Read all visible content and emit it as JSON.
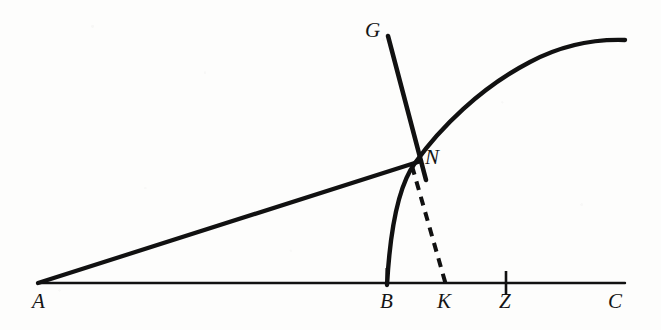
{
  "figure": {
    "kind": "geometric-diagram",
    "width": 661,
    "height": 330,
    "background_color": "#fdfdfc",
    "ink_color": "#111111"
  },
  "labels": {
    "a": "A",
    "b": "B",
    "c": "C",
    "g": "G",
    "k": "K",
    "n": "N",
    "z": "Z"
  },
  "geometry": {
    "baseline": {
      "name": "line-A-C",
      "from": [
        38,
        283
      ],
      "to": [
        625,
        283
      ],
      "stroke_width": 2.4
    },
    "ray_AN": {
      "name": "ray-A-through-N",
      "from": [
        38,
        283
      ],
      "to": [
        420,
        161
      ],
      "stroke_width": 4.2
    },
    "line_G": {
      "name": "line-G-through-N",
      "from": [
        388,
        36
      ],
      "to": [
        425,
        178
      ],
      "stroke_width": 4.6
    },
    "curve_BN": {
      "name": "curve-B-to-N-to-right",
      "start": [
        387,
        284
      ],
      "control_1": [
        392,
        215
      ],
      "control_2": [
        400,
        182
      ],
      "through_N": [
        415,
        163
      ],
      "far_control_1": [
        470,
        110
      ],
      "far_control_2": [
        545,
        44
      ],
      "end": [
        625,
        40
      ],
      "stroke_width": 4.4
    },
    "dashed_NK": {
      "name": "dashed-segment-N-to-K",
      "from": [
        413,
        166
      ],
      "to": [
        446,
        284
      ],
      "stroke_width": 4.0,
      "dash_pattern": "9 7"
    },
    "tick_B": {
      "name": "tick-at-B",
      "x": 387,
      "y_top": 268,
      "y_bottom": 284
    },
    "tick_Z": {
      "name": "tick-at-Z",
      "x": 506,
      "y_top": 271,
      "y_bottom": 295
    }
  },
  "label_positions": {
    "a": [
      32,
      291
    ],
    "b": [
      380,
      291
    ],
    "c": [
      608,
      291
    ],
    "g": [
      365,
      20
    ],
    "k": [
      437,
      291
    ],
    "n": [
      425,
      147
    ],
    "z": [
      499,
      291
    ]
  }
}
